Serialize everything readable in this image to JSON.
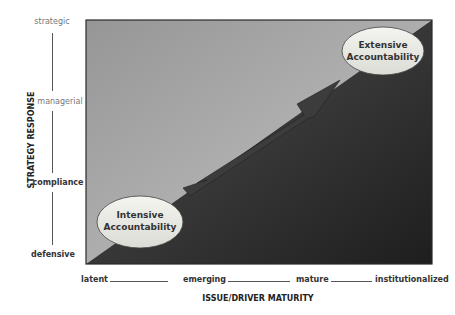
{
  "diagram": {
    "y_axis": {
      "title": "STRATEGY RESPONSE",
      "levels": [
        "strategic",
        "managerial",
        "compliance",
        "defensive"
      ]
    },
    "x_axis": {
      "title": "ISSUE/DRIVER MATURITY",
      "levels": [
        "latent",
        "emerging",
        "mature",
        "institutionalized"
      ]
    },
    "regions": {
      "upper_left_color": "#9c9c9c",
      "lower_right_color": "#262626"
    },
    "callouts": {
      "start": {
        "line1": "Intensive",
        "line2": "Accountability"
      },
      "end": {
        "line1": "Extensive",
        "line2": "Accountability"
      }
    },
    "arrow": {
      "direction": "from Intensive Accountability to Extensive Accountability"
    }
  }
}
